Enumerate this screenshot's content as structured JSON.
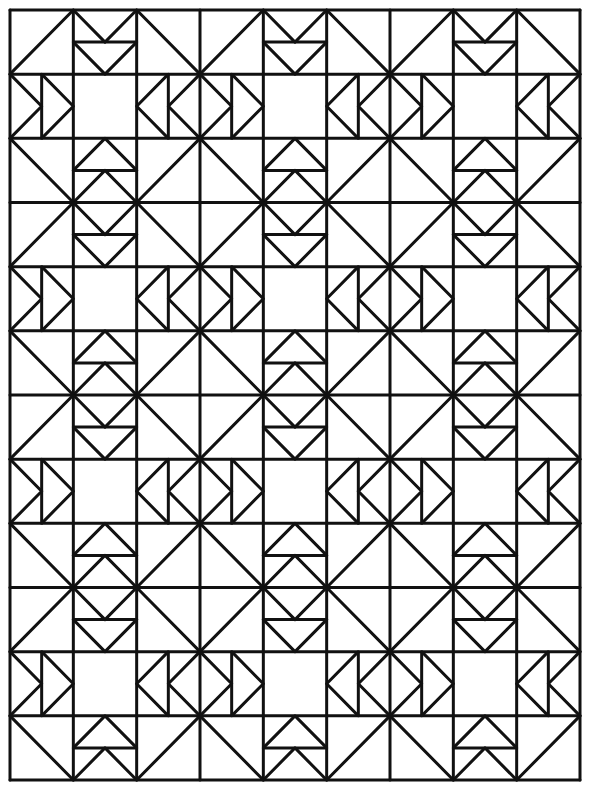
{
  "pattern": {
    "blocks_across": 3,
    "blocks_down": 4,
    "cells_per_block": 3,
    "line_color": "#111111",
    "background_color": "#ffffff",
    "block_elements": {
      "corner_cells": "half-square triangles (diagonals toward block center forming large X at block junctions)",
      "edge_cells": "double flying-geese pointing toward center square",
      "center_cell": "plain square"
    }
  }
}
